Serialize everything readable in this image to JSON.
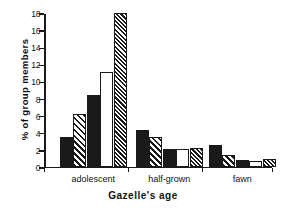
{
  "chart_data": {
    "type": "bar",
    "title": "",
    "xlabel": "Gazelle's age",
    "ylabel": "% of group members",
    "categories": [
      "adolescent",
      "half-grown",
      "fawn"
    ],
    "ylim": [
      0,
      18
    ],
    "yticks": [
      0,
      2,
      4,
      6,
      8,
      10,
      12,
      14,
      16,
      18
    ],
    "ytick_labels": [
      "0",
      "2",
      "4",
      "6",
      "8",
      "10",
      "12",
      "14",
      "16",
      "18"
    ],
    "grid": false,
    "legend": "none",
    "series": [
      {
        "name": "series-1",
        "pattern": "solid-black",
        "values": [
          3.5,
          4.3,
          2.5
        ]
      },
      {
        "name": "series-2",
        "pattern": "diagonal-hatch",
        "values": [
          6.1,
          3.5,
          1.4
        ]
      },
      {
        "name": "series-3",
        "pattern": "solid-black",
        "values": [
          8.4,
          2.05,
          0.8
        ]
      },
      {
        "name": "series-4",
        "pattern": "white",
        "values": [
          11.0,
          2.05,
          0.6
        ]
      },
      {
        "name": "series-5",
        "pattern": "dense-hatch",
        "values": [
          18.0,
          2.2,
          0.9
        ]
      }
    ]
  },
  "colors": {
    "ink": "#1a1a1a",
    "background": "#ffffff"
  }
}
